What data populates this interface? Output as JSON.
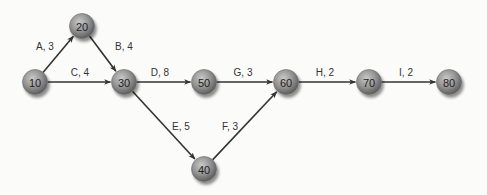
{
  "diagram": {
    "type": "activity-on-arrow network",
    "background": "#fbfbfa",
    "node_color": "#8a8a8a",
    "edge_color": "#333333",
    "nodes": [
      {
        "id": "10",
        "label": "10",
        "x": 35,
        "y": 82
      },
      {
        "id": "20",
        "label": "20",
        "x": 82,
        "y": 26
      },
      {
        "id": "30",
        "label": "30",
        "x": 124,
        "y": 82
      },
      {
        "id": "40",
        "label": "40",
        "x": 204,
        "y": 169
      },
      {
        "id": "50",
        "label": "50",
        "x": 204,
        "y": 82
      },
      {
        "id": "60",
        "label": "60",
        "x": 286,
        "y": 82
      },
      {
        "id": "70",
        "label": "70",
        "x": 369,
        "y": 82
      },
      {
        "id": "80",
        "label": "80",
        "x": 449,
        "y": 82
      }
    ],
    "edges": [
      {
        "from": "10",
        "to": "20",
        "label": "A, 3",
        "lx": 45,
        "ly": 46
      },
      {
        "from": "20",
        "to": "30",
        "label": "B, 4",
        "lx": 124,
        "ly": 46
      },
      {
        "from": "10",
        "to": "30",
        "label": "C, 4",
        "lx": 80,
        "ly": 72
      },
      {
        "from": "30",
        "to": "50",
        "label": "D, 8",
        "lx": 160,
        "ly": 72
      },
      {
        "from": "30",
        "to": "40",
        "label": "E, 5",
        "lx": 181,
        "ly": 126
      },
      {
        "from": "40",
        "to": "60",
        "label": "F, 3",
        "lx": 230,
        "ly": 126
      },
      {
        "from": "50",
        "to": "60",
        "label": "G, 3",
        "lx": 243,
        "ly": 72
      },
      {
        "from": "60",
        "to": "70",
        "label": "H, 2",
        "lx": 325,
        "ly": 72
      },
      {
        "from": "70",
        "to": "80",
        "label": "I, 2",
        "lx": 406,
        "ly": 72
      }
    ]
  }
}
